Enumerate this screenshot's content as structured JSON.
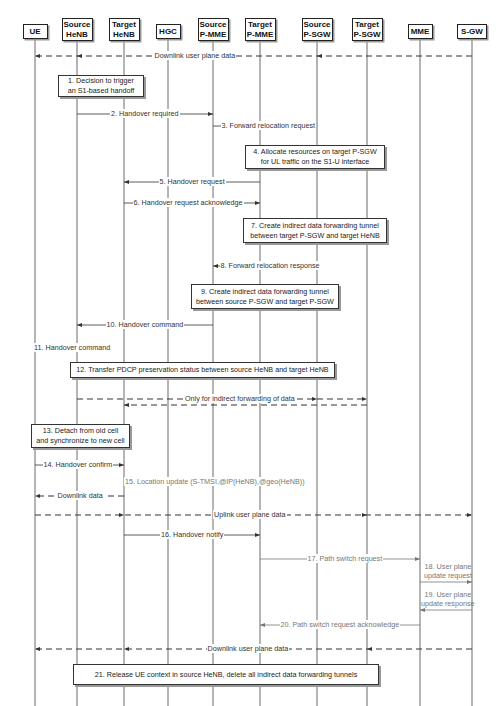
{
  "diagram": {
    "actors": [
      {
        "id": "ue",
        "label": "UE",
        "x": 35
      },
      {
        "id": "source-henb",
        "label": "Source\nHeNB",
        "x": 77
      },
      {
        "id": "target-henb",
        "label": "Target\nHeNB",
        "x": 124
      },
      {
        "id": "hgc",
        "label": "HGC",
        "x": 168
      },
      {
        "id": "source-p-mme",
        "label": "Source\nP-MME",
        "x": 213
      },
      {
        "id": "target-p-mme",
        "label": "Target\nP-MME",
        "x": 260
      },
      {
        "id": "source-p-sgw",
        "label": "Source\nP-SGW",
        "x": 317
      },
      {
        "id": "target-p-sgw",
        "label": "Target\nP-SGW",
        "x": 367
      },
      {
        "id": "mme",
        "label": "MME",
        "x": 420
      },
      {
        "id": "s-gw",
        "label": "S-GW",
        "x": 472
      }
    ],
    "messages": [
      {
        "label": "Downlink user plane data",
        "y": 56,
        "from": 472,
        "to": 35,
        "dashed": true,
        "mid_arrows": [
          77,
          317
        ],
        "label_x": 195
      },
      {
        "label": "2. Handover required",
        "y": 114,
        "from": 77,
        "to": 213,
        "dashed": false,
        "label_x": 145
      },
      {
        "label": "3. Forward relocation request",
        "y": 126,
        "from": 213,
        "to": 260,
        "dashed": false,
        "label_x": 268
      },
      {
        "label": "5. Handover request",
        "y": 182,
        "from": 260,
        "to": 124,
        "dashed": false,
        "label_x": 192
      },
      {
        "label": "6. Handover request acknowledge",
        "y": 203,
        "from": 124,
        "to": 260,
        "dashed": false,
        "label_x": 188
      },
      {
        "label": "8. Forward relocation response",
        "y": 266,
        "from": 260,
        "to": 213,
        "dashed": false,
        "label_x": 270
      },
      {
        "label": "10. Handover command",
        "y": 325,
        "from": 213,
        "to": 77,
        "dashed": false,
        "label_x": 145
      },
      {
        "label": "11. Handover command",
        "y": 348,
        "from": 77,
        "to": 35,
        "dashed": false,
        "label_x": 72
      },
      {
        "label": "Only for indirect forwarding of data",
        "y": 399,
        "from": 77,
        "to": 367,
        "dashed": true,
        "mid_arrows": [
          317
        ],
        "label_x": 240
      },
      {
        "label": "",
        "y": 405,
        "from": 367,
        "to": 124,
        "dashed": true
      },
      {
        "label": "14. Handover confirm",
        "y": 465,
        "from": 35,
        "to": 124,
        "dashed": false,
        "label_x": 78
      },
      {
        "label": "15. Location update (S-TMSI,@IP(HeNB),@geo(HeNB))",
        "y": 482,
        "from": 124,
        "to": 168,
        "dashed": false,
        "grey": true,
        "label_x": 215
      },
      {
        "label": "Downlink data",
        "y": 496,
        "from": 124,
        "to": 35,
        "dashed": true,
        "label_x": 80
      },
      {
        "label": "Uplink user plane data",
        "y": 515,
        "from": 35,
        "to": 472,
        "dashed": true,
        "mid_arrows": [
          124,
          367
        ],
        "label_x": 250
      },
      {
        "label": "16. Handover notify",
        "y": 535,
        "from": 124,
        "to": 260,
        "dashed": false,
        "label_x": 192
      },
      {
        "label": "17. Path switch request",
        "y": 559,
        "from": 260,
        "to": 420,
        "dashed": false,
        "grey": true,
        "label_x": 345
      },
      {
        "label": "18. User plane\nupdate request",
        "y": 582,
        "from": 420,
        "to": 472,
        "dashed": false,
        "grey": true,
        "label_x": 448
      },
      {
        "label": "19. User plane\nupdate response",
        "y": 610,
        "from": 472,
        "to": 420,
        "dashed": false,
        "grey": true,
        "label_x": 448
      },
      {
        "label": "20. Path switch request acknowledge",
        "y": 625,
        "from": 420,
        "to": 260,
        "dashed": false,
        "grey": true,
        "label_x": 340
      },
      {
        "label": "Downlink user plane data",
        "y": 649,
        "from": 472,
        "to": 35,
        "dashed": true,
        "mid_arrows": [
          124,
          367
        ],
        "label_x": 248
      }
    ],
    "notes": [
      {
        "label": "1. Decision to trigger\nan S1-based handoff",
        "x": 58,
        "y": 75,
        "w": 86,
        "h": 22
      },
      {
        "label": "4. Allocate resources on target P-SGW\nfor UL traffic on the S1-U interface",
        "x": 245,
        "y": 145,
        "w": 140,
        "h": 24
      },
      {
        "label": "7. Create indirect data forwarding tunnel\nbetween target P-SGW and target HeNB",
        "x": 243,
        "y": 218,
        "w": 144,
        "h": 25
      },
      {
        "label": "9. Create indirect data forwarding tunnel\nbetween source P-SGW and target P-SGW",
        "x": 191,
        "y": 284,
        "w": 148,
        "h": 25
      },
      {
        "label": "12. Transfer PDCP preservation status between source HeNB and target HeNB",
        "x": 70,
        "y": 362,
        "w": 265,
        "h": 16
      },
      {
        "label": "13. Detach from old cell\nand synchronize to new cell",
        "x": 31,
        "y": 424,
        "w": 99,
        "h": 24
      },
      {
        "label": "21. Release UE context in source HeNB, delete all indirect data forwarding tunnels",
        "x": 73,
        "y": 664,
        "w": 306,
        "h": 21
      }
    ]
  }
}
